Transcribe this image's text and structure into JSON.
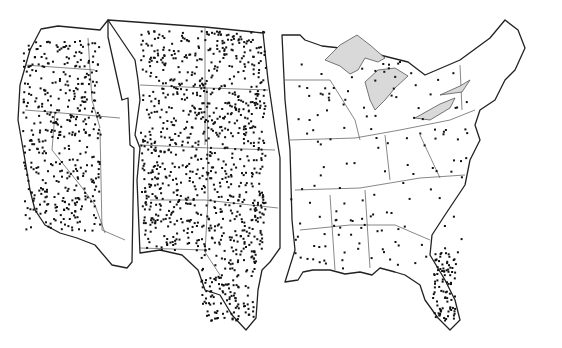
{
  "map": {
    "type": "dot-density",
    "region": "contiguous United States",
    "layout": "split into three horizontally offset sections",
    "colors": {
      "background": "#ffffff",
      "outline": "#222222",
      "state_border": "#555555",
      "lakes": "#d9d9d9",
      "dots": "#111111"
    },
    "sections": [
      {
        "name": "west",
        "density": "high"
      },
      {
        "name": "plains",
        "density": "very high"
      },
      {
        "name": "east",
        "density": "low",
        "cluster": "south florida"
      }
    ]
  }
}
